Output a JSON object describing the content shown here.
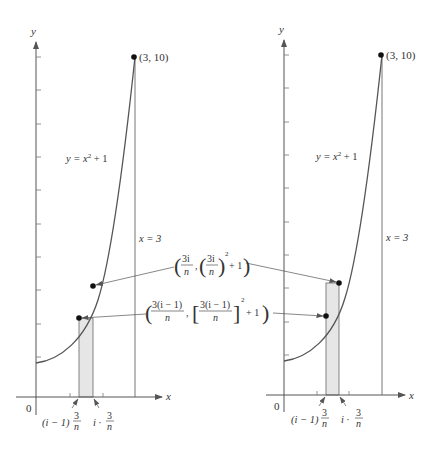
{
  "figure": {
    "colors": {
      "axis": "#555555",
      "curve": "#555555",
      "rect_fill": "#e6e6e6",
      "text": "#333333"
    },
    "panels": [
      {
        "id": "left",
        "axis_y_label": "y",
        "axis_x_label": "x",
        "origin_label": "0",
        "endpoint_label": "(3, 10)",
        "curve_label": "y = x² + 1",
        "curve_label_parts": {
          "lhs": "y = x",
          "exp": "2",
          "rhs": " + 1"
        },
        "vertical_line_label": "x = 3",
        "rect_height_from": "left endpoint",
        "x_tick_labels": {
          "left": "(i − 1)",
          "left_frac_num": "3",
          "left_frac_den": "n",
          "right": "i ·",
          "right_frac_num": "3",
          "right_frac_den": "n"
        }
      },
      {
        "id": "right",
        "axis_y_label": "y",
        "axis_x_label": "x",
        "origin_label": "0",
        "endpoint_label": "(3, 10)",
        "curve_label": "y = x² + 1",
        "curve_label_parts": {
          "lhs": "y = x",
          "exp": "2",
          "rhs": " + 1"
        },
        "vertical_line_label": "x = 3",
        "rect_height_from": "right endpoint",
        "x_tick_labels": {
          "left": "(i − 1)",
          "left_frac_num": "3",
          "left_frac_den": "n",
          "right": "i ·",
          "right_frac_num": "3",
          "right_frac_den": "n"
        }
      }
    ],
    "annotations": {
      "right_point": {
        "text": "(3i/n, (3i/n)² + 1)",
        "frac1_num": "3i",
        "frac1_den": "n",
        "frac2_num": "3i",
        "frac2_den": "n",
        "exp": "2",
        "tail": "+ 1"
      },
      "left_point": {
        "text": "(3(i − 1)/n, [3(i − 1)/n]² + 1)",
        "frac1_num": "3(i − 1)",
        "frac1_den": "n",
        "frac2_num": "3(i − 1)",
        "frac2_den": "n",
        "exp": "2",
        "tail": "+ 1"
      }
    }
  }
}
